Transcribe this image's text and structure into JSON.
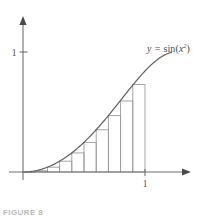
{
  "figure": {
    "caption": "FIGURE 8",
    "curve_label": {
      "variable": "y",
      "equals": "=",
      "function": "sin",
      "open_paren": "(",
      "argument": "x",
      "exponent": "2",
      "close_paren": ")",
      "full_text": "y = sin(x²)"
    },
    "axes": {
      "x_tick_labels": [
        "1"
      ],
      "y_tick_labels": [
        "1"
      ],
      "x_axis_name": "x-axis",
      "y_axis_name": "y-axis",
      "origin_px": [
        23,
        172
      ],
      "x_unit_px": 145,
      "y_unit_px": 52,
      "x_arrow_end_px": 190,
      "y_arrow_end_px": 18
    },
    "colors": {
      "axis": "#6f6f6f",
      "curve": "#5e5e5e",
      "rectangle": "#9b9b9b",
      "label_text": "#4c4c4c",
      "caption_text": "#b9b9b9",
      "background": "#ffffff"
    }
  },
  "chart_data": {
    "type": "area",
    "title": "",
    "subtitle": "",
    "xlabel": "",
    "ylabel": "",
    "xlim": [
      0,
      1.22
    ],
    "ylim": [
      0,
      1.3
    ],
    "grid": false,
    "legend": "none",
    "annotations": [
      {
        "text": "y = sin(x²)",
        "x": 1.02,
        "y": 1.18
      }
    ],
    "xticks": [
      1
    ],
    "xtick_labels": [
      "1"
    ],
    "yticks": [
      1
    ],
    "ytick_labels": [
      "1"
    ],
    "series": [
      {
        "name": "y = sin(x^2)",
        "type": "line",
        "x": [
          0.0,
          0.1,
          0.2,
          0.3,
          0.4,
          0.5,
          0.6,
          0.7,
          0.8,
          0.9,
          1.0,
          1.1,
          1.2
        ],
        "y": [
          0.0,
          0.01,
          0.04,
          0.09,
          0.159,
          0.247,
          0.352,
          0.47,
          0.592,
          0.729,
          0.841,
          0.936,
          0.991
        ]
      },
      {
        "name": "left-endpoint Riemann rectangles",
        "type": "bar",
        "n_rectangles": 10,
        "interval": [
          0,
          1
        ],
        "delta_x": 0.1,
        "left_endpoints": [
          0.0,
          0.1,
          0.2,
          0.3,
          0.4,
          0.5,
          0.6,
          0.7,
          0.8,
          0.9
        ],
        "heights": [
          0.0,
          0.01,
          0.04,
          0.09,
          0.159,
          0.247,
          0.352,
          0.47,
          0.592,
          0.729
        ]
      }
    ]
  }
}
